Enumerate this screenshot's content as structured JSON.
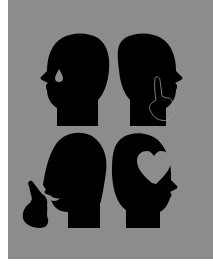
{
  "illustration": {
    "background_color": "#8c8c8c",
    "silhouette_color": "#000000",
    "layout": "2x2 grid of profile head silhouettes",
    "heads": [
      {
        "position": "top-left",
        "facing": "left",
        "detail": "teardrop-icon"
      },
      {
        "position": "top-right",
        "facing": "right",
        "detail": "raised-index-finger-hand-icon"
      },
      {
        "position": "bottom-left",
        "facing": "left",
        "detail": "pointing-hand-at-mouth-icon"
      },
      {
        "position": "bottom-right",
        "facing": "right",
        "detail": "heart-icon"
      }
    ]
  }
}
